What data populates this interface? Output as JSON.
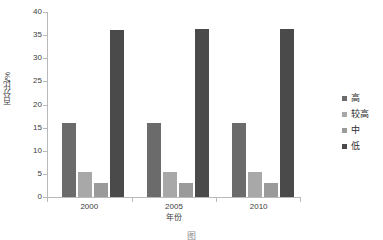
{
  "chart_data": {
    "type": "bar",
    "title": "",
    "subtitle": "",
    "xlabel": "年份",
    "ylabel": "百分比/%",
    "categories": [
      "2000",
      "2005",
      "2010"
    ],
    "series": [
      {
        "name": "高",
        "values": [
          16.1,
          16.0,
          16.0
        ],
        "color": "#6b6b6b"
      },
      {
        "name": "较高",
        "values": [
          5.5,
          5.5,
          5.4
        ],
        "color": "#a8a8a8"
      },
      {
        "name": "中",
        "values": [
          3.1,
          3.0,
          3.0
        ],
        "color": "#9a9a9a"
      },
      {
        "name": "低",
        "values": [
          36.2,
          36.3,
          36.3
        ],
        "color": "#4a4a4a"
      }
    ],
    "ylim": [
      0,
      40
    ],
    "ytick_values": [
      0,
      5,
      10,
      15,
      20,
      25,
      30,
      35,
      40
    ],
    "ytick_labels": [
      "0",
      "5",
      "10",
      "15",
      "20",
      "25",
      "30",
      "35",
      "40"
    ],
    "grid": false,
    "legend_position": "right",
    "axis_color": "#b9b9b9",
    "background": "#ffffff"
  },
  "legend": {
    "entries": [
      {
        "label": "高"
      },
      {
        "label": "较高"
      },
      {
        "label": "中"
      },
      {
        "label": "低"
      }
    ]
  },
  "caption": {
    "text": "图"
  }
}
